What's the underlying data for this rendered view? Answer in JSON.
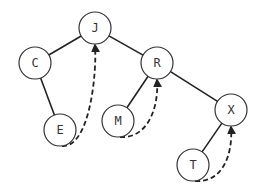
{
  "diagram": {
    "type": "threaded binary tree",
    "nodes": [
      {
        "id": "J",
        "label": "J"
      },
      {
        "id": "C",
        "label": "C"
      },
      {
        "id": "R",
        "label": "R"
      },
      {
        "id": "E",
        "label": "E"
      },
      {
        "id": "M",
        "label": "M"
      },
      {
        "id": "X",
        "label": "X"
      },
      {
        "id": "T",
        "label": "T"
      }
    ],
    "edges": [
      {
        "from": "J",
        "to": "C"
      },
      {
        "from": "J",
        "to": "R"
      },
      {
        "from": "C",
        "to": "E"
      },
      {
        "from": "R",
        "to": "M"
      },
      {
        "from": "R",
        "to": "X"
      },
      {
        "from": "X",
        "to": "T"
      }
    ],
    "threads": [
      {
        "from": "E",
        "to": "J"
      },
      {
        "from": "M",
        "to": "R"
      },
      {
        "from": "T",
        "to": "X"
      }
    ]
  }
}
